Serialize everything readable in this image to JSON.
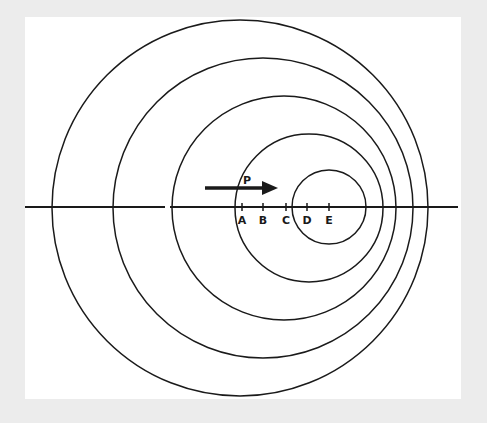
{
  "diagram": {
    "colors": {
      "background": "#ececec",
      "panel": "#ffffff",
      "stroke": "#1a1a1a"
    },
    "axis": {
      "y": 207,
      "x_start": 25,
      "x_end": 458,
      "gap": [
        165,
        170
      ]
    },
    "circles": [
      {
        "id": "wavefront-1",
        "cx": 240,
        "cy": 208,
        "r": 188
      },
      {
        "id": "wavefront-2",
        "cx": 263,
        "cy": 208,
        "r": 150
      },
      {
        "id": "wavefront-3",
        "cx": 284,
        "cy": 208,
        "r": 112
      },
      {
        "id": "wavefront-4",
        "cx": 309,
        "cy": 208,
        "r": 74
      },
      {
        "id": "wavefront-5",
        "cx": 329,
        "cy": 207,
        "r": 37
      }
    ],
    "arrow": {
      "label": "P",
      "x1": 205,
      "x2": 277,
      "y": 188
    },
    "points": [
      {
        "label": "A",
        "x": 242
      },
      {
        "label": "B",
        "x": 263
      },
      {
        "label": "C",
        "x": 286
      },
      {
        "label": "D",
        "x": 307
      },
      {
        "label": "E",
        "x": 329
      }
    ]
  }
}
